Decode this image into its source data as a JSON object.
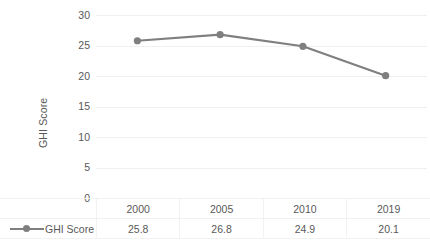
{
  "chart_data": {
    "type": "line",
    "title": "",
    "xlabel": "",
    "ylabel": "GHI Score",
    "categories": [
      "2000",
      "2005",
      "2010",
      "2019"
    ],
    "series": [
      {
        "name": "GHI Score",
        "values": [
          25.8,
          26.8,
          24.9,
          20.1
        ],
        "color": "#7f7f7f",
        "marker": "circle"
      }
    ],
    "ylim": [
      0,
      30
    ],
    "yticks": [
      0,
      5,
      10,
      15,
      20,
      25,
      30
    ],
    "ytick_labels": [
      "0",
      "5",
      "10",
      "15",
      "20",
      "25",
      "30"
    ],
    "grid": true,
    "grid_color": "#f0f0f0",
    "legend_position": "data-table-left",
    "data_table": {
      "visible": true,
      "header": [
        "",
        "2000",
        "2005",
        "2010",
        "2019"
      ],
      "rows": [
        {
          "label": "GHI Score",
          "cells": [
            "25.8",
            "26.8",
            "24.9",
            "20.1"
          ]
        }
      ]
    }
  },
  "axis": {
    "y_title": "GHI Score",
    "y_ticks": [
      "30",
      "25",
      "20",
      "15",
      "10",
      "5",
      "0"
    ]
  },
  "legend": {
    "marker_icon": "line-with-circle-marker-icon",
    "label": "GHI Score"
  },
  "table": {
    "years": [
      "2000",
      "2005",
      "2010",
      "2019"
    ],
    "values": [
      "25.8",
      "26.8",
      "24.9",
      "20.1"
    ]
  },
  "colors": {
    "series": "#7f7f7f",
    "text": "#595959",
    "gridline": "#f0f0f0",
    "table_border": "#f2f2f2",
    "background": "#ffffff"
  }
}
